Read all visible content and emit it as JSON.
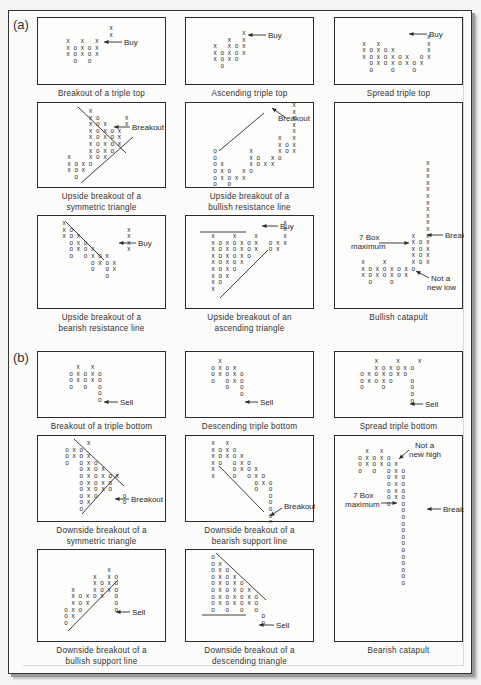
{
  "figure": {
    "sections": [
      {
        "id": "a",
        "label": "(a)",
        "x": 13,
        "y": 17
      },
      {
        "id": "b",
        "label": "(b)",
        "x": 13,
        "y": 350
      }
    ],
    "colors": {
      "ink": "#2a2a2a",
      "paper": "#fdfdfc",
      "shadow": "#9a9a9a"
    },
    "cell_pitch": {
      "dx": 7.2,
      "dy": 6.6
    },
    "panels": [
      {
        "id": "breakout-triple-top",
        "x": 37,
        "y": 17,
        "w": 129,
        "h": 68,
        "caption": [
          "Breakout of a triple top"
        ],
        "origin": {
          "x": 30,
          "y": 12
        },
        "cells": [
          "      X",
          "      X",
          "X  X  X",
          "XOXOXOX",
          "XOXOXOX",
          " O  O  "
        ],
        "cells_override": [
          "      X",
          "      X",
          "X X X",
          "XOXOX",
          "XOXOX",
          " O O"
        ],
        "lines": [],
        "arrows": [
          {
            "x1": 84,
            "y1": 24,
            "x2": 66,
            "y2": 24,
            "label": "Buy",
            "lx": 86,
            "ly": 27
          }
        ]
      },
      {
        "id": "ascending-triple-top",
        "x": 185,
        "y": 17,
        "w": 129,
        "h": 68,
        "caption": [
          "Ascending triple top"
        ],
        "origin": {
          "x": 29,
          "y": 17
        },
        "cells": [
          "    X",
          "  X X",
          "X XOX",
          "XOXOX",
          "XOXO",
          " O"
        ],
        "lines": [],
        "arrows": [
          {
            "x1": 80,
            "y1": 17,
            "x2": 62,
            "y2": 17,
            "label": "Buy",
            "lx": 82,
            "ly": 20
          }
        ]
      },
      {
        "id": "spread-triple-top",
        "x": 334,
        "y": 17,
        "w": 129,
        "h": 68,
        "caption": [
          "Spread triple top"
        ],
        "origin": {
          "x": 29,
          "y": 21
        },
        "cells": [
          "         X",
          "X X      X",
          "XOXOX    X",
          "XOXOXOX OX",
          " OXOXOXOX",
          " O  O  O"
        ],
        "lines": [],
        "arrows": [
          {
            "x1": 92,
            "y1": 16,
            "x2": 74,
            "y2": 16,
            "label": "Buy",
            "lx": 94,
            "ly": 19
          }
        ]
      },
      {
        "id": "upside-breakout-symmetric-triangle",
        "x": 37,
        "y": 102,
        "w": 129,
        "h": 86,
        "caption": [
          "Upside breakout of a",
          "symmetric triangle"
        ],
        "origin": {
          "x": 31,
          "y": 10
        },
        "cells": [
          "   X",
          "   XO   X",
          "   XOX  X",
          "   XOXOX",
          "   XOXOX",
          "   XOXOX",
          "   XOXO",
          "X  XOX",
          "XOXO",
          "XOX",
          " O"
        ],
        "lines": [
          {
            "x1": 40,
            "y1": 4,
            "x2": 88,
            "y2": 50
          },
          {
            "x1": 43,
            "y1": 80,
            "x2": 95,
            "y2": 34
          }
        ],
        "arrows": [
          {
            "x1": 92,
            "y1": 24,
            "x2": 76,
            "y2": 24,
            "label": "Breakout",
            "lx": 94,
            "ly": 27
          }
        ]
      },
      {
        "id": "upside-breakout-bullish-resistance-line",
        "x": 185,
        "y": 102,
        "w": 129,
        "h": 86,
        "caption": [
          "Upside breakout of a",
          "bullish resistance line"
        ],
        "origin": {
          "x": 29,
          "y": 4
        },
        "cells": [
          "           X",
          "           X",
          "           X",
          "           X",
          "           X",
          "         X X",
          "         XOX",
          "O    X   XOX",
          "O    XO XO",
          "OX   XOXX",
          "OXO XO",
          "OXOXX",
          "O O"
        ],
        "lines": [
          {
            "x1": 33,
            "y1": 48,
            "x2": 78,
            "y2": 10
          }
        ],
        "arrows": [
          {
            "x1": 100,
            "y1": 15,
            "x2": 86,
            "y2": 5,
            "label": "Breakout",
            "lx": 92,
            "ly": 18
          }
        ]
      },
      {
        "id": "upside-breakout-bearish-resistance-line",
        "x": 37,
        "y": 215,
        "w": 129,
        "h": 94,
        "caption": [
          "Upside breakout of a",
          "bearish resistance line"
        ],
        "origin": {
          "x": 26,
          "y": 9
        },
        "cells": [
          "X",
          "XO       X",
          "XOX      X",
          " OXO     X",
          " OXOX    X",
          " O OXOX",
          "    OXOX",
          "    O OX",
          "      O"
        ],
        "lines": [
          {
            "x1": 28,
            "y1": 6,
            "x2": 66,
            "y2": 44
          }
        ],
        "arrows": [
          {
            "x1": 98,
            "y1": 27,
            "x2": 81,
            "y2": 27,
            "label": "Buy",
            "lx": 100,
            "ly": 30
          }
        ]
      },
      {
        "id": "upside-breakout-ascending-triangle",
        "x": 185,
        "y": 215,
        "w": 129,
        "h": 94,
        "caption": [
          "Upside breakout of an",
          "ascending triangle"
        ],
        "origin": {
          "x": 27,
          "y": 22
        },
        "cells": [
          "X  X  X",
          "XOXOXOX",
          "XOXOXOX",
          "XOXOXO",
          "XOXOX",
          "XOXO",
          "XOX",
          "XO",
          "X"
        ],
        "cells_extra": [
          {
            "row": -2,
            "col": 10,
            "ch": "X"
          },
          {
            "row": -1,
            "col": 10,
            "ch": "X"
          },
          {
            "row": 0,
            "col": 10,
            "ch": "X"
          },
          {
            "row": 1,
            "col": 8,
            "ch": "O"
          },
          {
            "row": 1,
            "col": 9,
            "ch": "X"
          },
          {
            "row": 1,
            "col": 10,
            "ch": "X"
          },
          {
            "row": 2,
            "col": 8,
            "ch": "O"
          },
          {
            "row": 2,
            "col": 9,
            "ch": "X"
          }
        ],
        "lines": [
          {
            "x1": 14,
            "y1": 16,
            "x2": 60,
            "y2": 16
          },
          {
            "x1": 34,
            "y1": 82,
            "x2": 82,
            "y2": 34
          }
        ],
        "arrows": [
          {
            "x1": 92,
            "y1": 10,
            "x2": 76,
            "y2": 10,
            "label": "Buy",
            "lx": 94,
            "ly": 13
          }
        ]
      },
      {
        "id": "bullish-catapult",
        "x": 334,
        "y": 102,
        "w": 129,
        "h": 207,
        "caption": [
          "Bullish catapult"
        ],
        "origin": {
          "x": 28,
          "y": 62
        },
        "cells": [
          "         X",
          "         X",
          "         X",
          "         X",
          "         X",
          "         X",
          "         X",
          "         X",
          "         X",
          "         X",
          "         X",
          "       X X",
          "       XOX",
          "       XOX",
          "       XOX",
          "X  X   XOX",
          "XOXOXOXO",
          "XOXOXOX",
          " O  O"
        ],
        "lines": [],
        "arrows": [
          {
            "x1": 108,
            "y1": 132,
            "x2": 92,
            "y2": 132,
            "label": "Breakout",
            "lx": 110,
            "ly": 135
          },
          {
            "x1": 44,
            "y1": 140,
            "x2": 74,
            "y2": 140,
            "label": "",
            "lx": 0,
            "ly": 0
          },
          {
            "x1": 94,
            "y1": 175,
            "x2": 81,
            "y2": 168,
            "label": "",
            "lx": 0,
            "ly": 0
          }
        ],
        "texts": [
          {
            "t": "7 Box",
            "x": 24,
            "y": 137
          },
          {
            "t": "maximum",
            "x": 16,
            "y": 146
          },
          {
            "t": "Not a",
            "x": 96,
            "y": 178
          },
          {
            "t": "new low",
            "x": 92,
            "y": 187
          }
        ]
      },
      {
        "id": "breakout-triple-bottom",
        "x": 37,
        "y": 351,
        "w": 129,
        "h": 67,
        "caption": [
          "Breakout of a triple bottom"
        ],
        "origin": {
          "x": 33,
          "y": 17
        },
        "cells": [
          " X X",
          "OXOXO",
          "OXOXO",
          "O O O",
          "    O",
          "    O"
        ],
        "lines": [],
        "arrows": [
          {
            "x1": 80,
            "y1": 50,
            "x2": 66,
            "y2": 50,
            "label": "Sell",
            "lx": 82,
            "ly": 53
          }
        ]
      },
      {
        "id": "descending-triple-bottom",
        "x": 185,
        "y": 351,
        "w": 129,
        "h": 67,
        "caption": [
          "Descending triple bottom"
        ],
        "origin": {
          "x": 27,
          "y": 11
        },
        "cells": [
          " X",
          "OXOX",
          "OXOXO",
          "O OXO",
          "  O O",
          "    O"
        ],
        "lines": [],
        "arrows": [
          {
            "x1": 72,
            "y1": 50,
            "x2": 59,
            "y2": 50,
            "label": "Sell",
            "lx": 74,
            "ly": 53
          }
        ]
      },
      {
        "id": "spread-triple-bottom",
        "x": 334,
        "y": 351,
        "w": 129,
        "h": 67,
        "caption": [
          "Spread triple bottom"
        ],
        "origin": {
          "x": 27,
          "y": 11
        },
        "cells": [
          "  X  X  X",
          "  XOXOXO",
          "OXOXOXO",
          "OXOXO  O",
          "O  O   O",
          "       O",
          "       O"
        ],
        "lines": [],
        "arrows": [
          {
            "x1": 88,
            "y1": 52,
            "x2": 75,
            "y2": 52,
            "label": "Sell",
            "lx": 90,
            "ly": 55
          }
        ]
      },
      {
        "id": "downside-breakout-symmetric-triangle",
        "x": 37,
        "y": 435,
        "w": 129,
        "h": 87,
        "caption": [
          "Downside breakout of a",
          "symmetric triangle"
        ],
        "origin": {
          "x": 29,
          "y": 9
        },
        "cells": [
          "   X",
          "OXO",
          "OXOX",
          "O OXO",
          "  OXOX",
          "  OXOXOX",
          "  OXOXO",
          "  OXOXO",
          "  OXO   O",
          "  OX    O",
          "  O"
        ],
        "lines": [
          {
            "x1": 36,
            "y1": 3,
            "x2": 86,
            "y2": 50
          },
          {
            "x1": 44,
            "y1": 78,
            "x2": 80,
            "y2": 38
          }
        ],
        "arrows": [
          {
            "x1": 91,
            "y1": 63,
            "x2": 77,
            "y2": 63,
            "label": "Breakout",
            "lx": 93,
            "ly": 66
          }
        ]
      },
      {
        "id": "downside-breakout-bearish-support-line",
        "x": 185,
        "y": 435,
        "w": 129,
        "h": 87,
        "caption": [
          "Downside breakout of a",
          "bearish support line"
        ],
        "origin": {
          "x": 27,
          "y": 9
        },
        "cells": [
          "X X",
          "XOXO",
          "XOXOX",
          "XO OXO",
          "X  OXOX",
          "X  O OXO",
          "      OXO",
          "      O O",
          "        O",
          "        O",
          "        O",
          "        O",
          "        O"
        ],
        "lines": [
          {
            "x1": 33,
            "y1": 30,
            "x2": 78,
            "y2": 76
          }
        ],
        "arrows": [
          {
            "x1": 96,
            "y1": 72,
            "x2": 84,
            "y2": 80,
            "label": "Breakout",
            "lx": 98,
            "ly": 73
          }
        ]
      },
      {
        "id": "bearish-catapult",
        "x": 334,
        "y": 435,
        "w": 129,
        "h": 207,
        "caption": [
          "Bearish catapult"
        ],
        "origin": {
          "x": 25,
          "y": 17
        },
        "cells": [
          " X X",
          "OXOXO",
          "OXOXOX",
          "O O OXO",
          "    OXO",
          "    OXO",
          "    OXO",
          "    OXO",
          "    O O",
          "      O",
          "      O",
          "      O",
          "      O",
          "      O",
          "      O",
          "      O",
          "      O",
          "      O",
          "      O",
          "      O",
          "      O"
        ],
        "lines": [],
        "arrows": [
          {
            "x1": 106,
            "y1": 73,
            "x2": 92,
            "y2": 73,
            "label": "Breakout",
            "lx": 108,
            "ly": 76
          },
          {
            "x1": 46,
            "y1": 67,
            "x2": 62,
            "y2": 67,
            "label": "",
            "lx": 0,
            "ly": 0
          },
          {
            "x1": 74,
            "y1": 14,
            "x2": 64,
            "y2": 23,
            "label": "",
            "lx": 0,
            "ly": 0
          }
        ],
        "texts": [
          {
            "t": "Not a",
            "x": 80,
            "y": 12
          },
          {
            "t": "new high",
            "x": 74,
            "y": 21
          },
          {
            "t": "7 Box",
            "x": 18,
            "y": 62
          },
          {
            "t": "maximum",
            "x": 10,
            "y": 71
          }
        ]
      },
      {
        "id": "downside-breakout-bullish-support-line",
        "x": 37,
        "y": 549,
        "w": 129,
        "h": 93,
        "caption": [
          "Downside breakout of a",
          "bullish support line"
        ],
        "origin": {
          "x": 28,
          "y": 22
        },
        "cells": [
          "        X",
          "      X XO",
          "      XOXO",
          "  X   XOXO",
          "  XOXOXO O",
          "  XOXOX  O",
          "OXOX     O",
          "OX",
          "O"
        ],
        "cells_override": [
          "      X",
          "    X XO",
          "    XOXO",
          " X  XOXO",
          " XOXOX O",
          " XOX   O",
          "OXO    O",
          "OX",
          "O"
        ],
        "lines": [
          {
            "x1": 30,
            "y1": 81,
            "x2": 80,
            "y2": 30
          }
        ],
        "arrows": [
          {
            "x1": 92,
            "y1": 62,
            "x2": 78,
            "y2": 62,
            "label": "Sell",
            "lx": 94,
            "ly": 65
          }
        ]
      },
      {
        "id": "downside-breakout-descending-triangle",
        "x": 185,
        "y": 549,
        "w": 129,
        "h": 93,
        "caption": [
          "Downside breakout of a",
          "descending triangle"
        ],
        "origin": {
          "x": 27,
          "y": 9
        },
        "cells": [
          "O",
          "OX",
          "OXO",
          "OXOX",
          "OXOXO",
          "OXOXOX",
          "OXOXOXO",
          "OXOXOXO",
          "O O O O",
          "       O",
          "       O"
        ],
        "lines": [
          {
            "x1": 30,
            "y1": 3,
            "x2": 80,
            "y2": 50
          },
          {
            "x1": 16,
            "y1": 65,
            "x2": 60,
            "y2": 65
          }
        ],
        "arrows": [
          {
            "x1": 88,
            "y1": 75,
            "x2": 73,
            "y2": 75,
            "label": "Sell",
            "lx": 90,
            "ly": 78
          }
        ]
      }
    ]
  }
}
